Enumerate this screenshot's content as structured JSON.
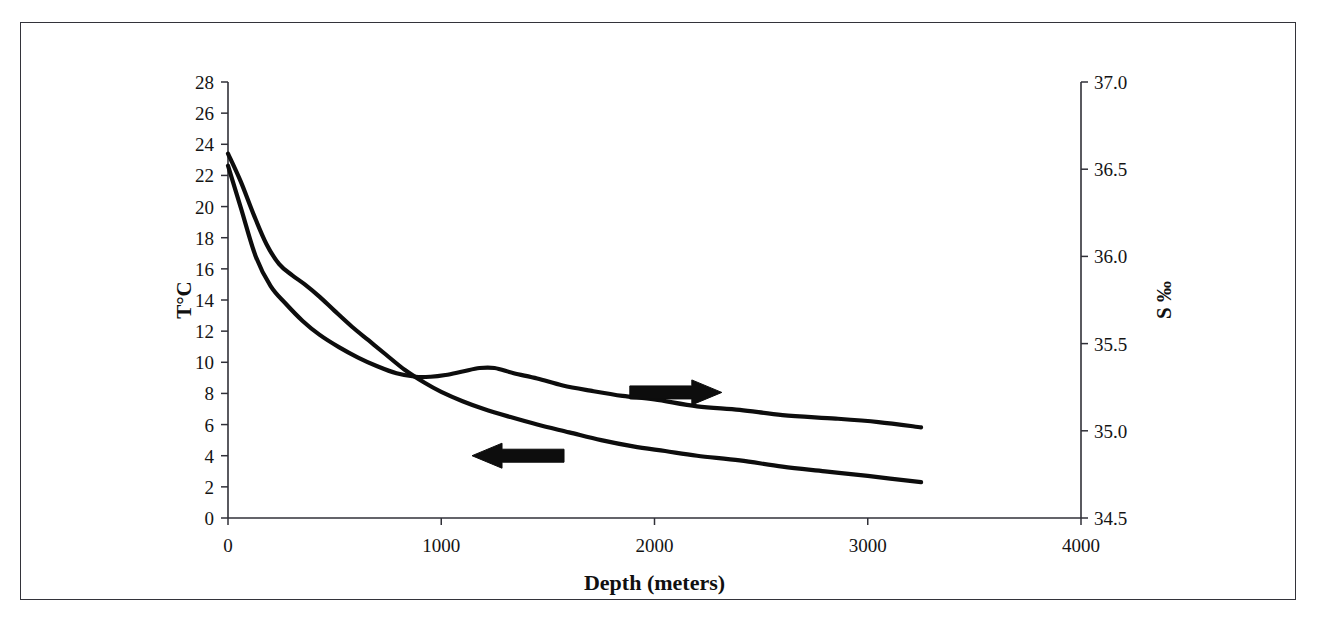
{
  "figure": {
    "frame_color": "#33333a",
    "line_color": "#0d0d0d",
    "background": "#ffffff"
  },
  "axes": {
    "x_title": "Depth (meters)",
    "y_left_title": "T°C",
    "y_right_title": "S ‰",
    "x_ticks": [
      "0",
      "1000",
      "2000",
      "3000",
      "4000"
    ],
    "y_left_ticks": [
      "0",
      "2",
      "4",
      "6",
      "8",
      "10",
      "12",
      "14",
      "16",
      "18",
      "20",
      "22",
      "24",
      "26",
      "28"
    ],
    "y_right_ticks": [
      "34.5",
      "35.0",
      "35.5",
      "36.0",
      "36.5",
      "37.0"
    ]
  },
  "annotations": [
    {
      "name": "salinity-arrow",
      "glyph": "arrow-right",
      "direction": "right",
      "x_data": 2100,
      "y_value": 35.22
    },
    {
      "name": "temperature-arrow",
      "glyph": "arrow-left",
      "direction": "left",
      "x_data": 1360,
      "y_value": 4.0
    }
  ],
  "chart_data": {
    "type": "line",
    "title": "",
    "xlabel": "Depth (meters)",
    "ylabel": "T°C",
    "ylabel_secondary": "S ‰",
    "xlim": [
      0,
      4000
    ],
    "ylim": [
      0,
      28
    ],
    "ylim_secondary": [
      34.5,
      37.0
    ],
    "xticks": [
      0,
      1000,
      2000,
      3000,
      4000
    ],
    "yticks": [
      0,
      2,
      4,
      6,
      8,
      10,
      12,
      14,
      16,
      18,
      20,
      22,
      24,
      26,
      28
    ],
    "yticks_secondary": [
      34.5,
      35.0,
      35.5,
      36.0,
      36.5,
      37.0
    ],
    "grid": false,
    "legend": "none (curves identified by arrows)",
    "series": [
      {
        "name": "Temperature",
        "axis": "left",
        "unit": "°C",
        "annotation": "arrow-left",
        "x": [
          0,
          60,
          120,
          180,
          240,
          300,
          360,
          430,
          500,
          580,
          660,
          740,
          830,
          920,
          1000,
          1100,
          1200,
          1320,
          1450,
          1600,
          1750,
          1900,
          2050,
          2200,
          2400,
          2600,
          2800,
          3000,
          3250
        ],
        "y": [
          23.4,
          21.6,
          19.5,
          17.6,
          16.3,
          15.6,
          15.0,
          14.2,
          13.3,
          12.3,
          11.4,
          10.5,
          9.5,
          8.7,
          8.1,
          7.5,
          7.0,
          6.5,
          6.0,
          5.5,
          5.0,
          4.6,
          4.3,
          4.0,
          3.7,
          3.3,
          3.0,
          2.7,
          2.3
        ]
      },
      {
        "name": "Salinity",
        "axis": "right",
        "unit": "‰",
        "annotation": "arrow-right",
        "x": [
          0,
          60,
          130,
          200,
          270,
          350,
          430,
          520,
          610,
          700,
          790,
          880,
          950,
          1020,
          1100,
          1180,
          1250,
          1340,
          1450,
          1570,
          1700,
          1850,
          2000,
          2200,
          2400,
          2600,
          2850,
          3050,
          3250
        ],
        "y": [
          36.52,
          36.28,
          36.0,
          35.83,
          35.73,
          35.63,
          35.55,
          35.48,
          35.42,
          35.37,
          35.33,
          35.31,
          35.31,
          35.32,
          35.34,
          35.36,
          35.36,
          35.33,
          35.3,
          35.26,
          35.23,
          35.2,
          35.18,
          35.14,
          35.12,
          35.09,
          35.07,
          35.05,
          35.02
        ]
      }
    ]
  }
}
